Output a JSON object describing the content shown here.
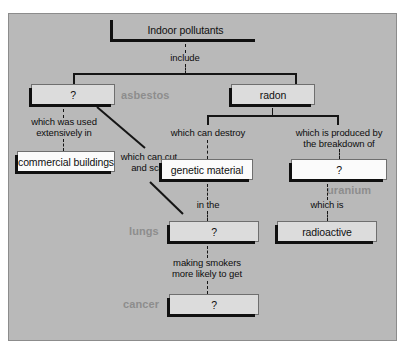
{
  "diagram": {
    "top_remnant_text": "",
    "nodes": {
      "indoor_pollutants": {
        "label": "Indoor pollutants",
        "style": "transparent"
      },
      "asbestos_q": {
        "label": "?",
        "style": "light"
      },
      "radon": {
        "label": "radon",
        "style": "light"
      },
      "commercial": {
        "label": "commercial buildings",
        "style": "white"
      },
      "genetic": {
        "label": "genetic material",
        "style": "white"
      },
      "uranium_q": {
        "label": "?",
        "style": "white"
      },
      "lungs_q": {
        "label": "?",
        "style": "light"
      },
      "radioactive": {
        "label": "radioactive",
        "style": "light"
      },
      "cancer_q": {
        "label": "?",
        "style": "light"
      }
    },
    "link_labels": {
      "include": "include",
      "which_was_used": "which was used\nextensively in",
      "which_can_cut": "which can cut\nand scar",
      "which_can_destroy": "which can destroy",
      "which_is_produced": "which is produced by\nthe breakdown of",
      "in_the": "in the",
      "which_is": "which is",
      "making_smokers": "making smokers\nmore likely to get"
    },
    "answer_labels": {
      "asbestos": "asbestos",
      "uranium": "uranium",
      "lungs": "lungs",
      "cancer": "cancer"
    },
    "colors": {
      "panel_background": "#b9b9b9",
      "box_light_fill": "#dcdcdc",
      "box_white_fill": "#fbfbfb",
      "line": "#151515",
      "answer_text": "#8d8d8d",
      "body_text": "#101010"
    }
  }
}
